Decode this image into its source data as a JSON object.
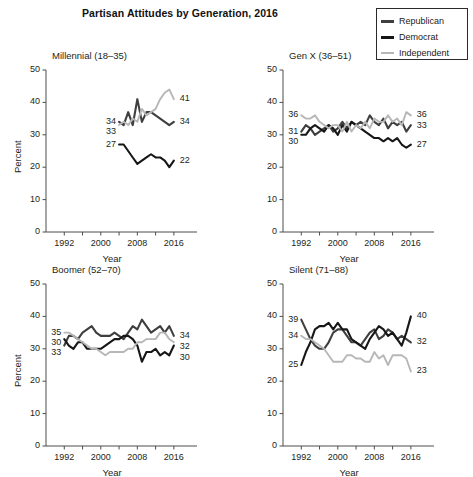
{
  "figure": {
    "title": "Partisan Attitudes by Generation, 2016",
    "xlabel": "Year",
    "ylabel": "Percent"
  },
  "legend": {
    "position": "top-right",
    "items": [
      {
        "label": "Republican",
        "color": "#3f3f3f"
      },
      {
        "label": "Democrat",
        "color": "#171717"
      },
      {
        "label": "Independent",
        "color": "#b7b7b7"
      }
    ]
  },
  "axes": {
    "yticks": [
      "0",
      "10",
      "20",
      "30",
      "40",
      "50"
    ],
    "xticks": [
      "1992",
      "2000",
      "2008",
      "2016"
    ],
    "ylim": [
      0,
      50
    ],
    "xlim": [
      1988,
      2018
    ],
    "grid": false
  },
  "chart_data": [
    {
      "type": "line",
      "title": "Millennial (18–35)",
      "xlabel": "Year",
      "ylabel": "Percent",
      "ylim": [
        0,
        50
      ],
      "xlim": [
        1988,
        2018
      ],
      "x": [
        2004,
        2005,
        2006,
        2007,
        2008,
        2009,
        2010,
        2011,
        2012,
        2013,
        2014,
        2015,
        2016
      ],
      "series": [
        {
          "name": "Republican",
          "color": "#3f3f3f",
          "start_label": "34",
          "end_label": "34",
          "values": [
            34,
            33,
            37,
            33,
            41,
            34,
            37,
            37,
            36,
            35,
            34,
            33,
            34
          ]
        },
        {
          "name": "Democrat",
          "color": "#171717",
          "start_label": "27",
          "end_label": "22",
          "values": [
            27,
            27,
            25,
            23,
            21,
            22,
            23,
            24,
            23,
            23,
            22,
            20,
            22
          ]
        },
        {
          "name": "Independent",
          "color": "#b7b7b7",
          "start_label": "33",
          "end_label": "41",
          "values": [
            33,
            34,
            33,
            35,
            34,
            38,
            36,
            37,
            38,
            41,
            43,
            44,
            41
          ]
        }
      ]
    },
    {
      "type": "line",
      "title": "Gen X (36–51)",
      "xlabel": "Year",
      "ylabel": "Percent",
      "ylim": [
        0,
        50
      ],
      "xlim": [
        1988,
        2018
      ],
      "x": [
        1992,
        1993,
        1994,
        1995,
        1996,
        1997,
        1998,
        1999,
        2000,
        2001,
        2002,
        2003,
        2004,
        2005,
        2006,
        2007,
        2008,
        2009,
        2010,
        2011,
        2012,
        2013,
        2014,
        2015,
        2016
      ],
      "series": [
        {
          "name": "Republican",
          "color": "#3f3f3f",
          "start_label": "31",
          "end_label": "33",
          "values": [
            31,
            33,
            32,
            30,
            31,
            32,
            33,
            31,
            32,
            34,
            32,
            34,
            33,
            34,
            33,
            36,
            34,
            33,
            35,
            32,
            34,
            33,
            34,
            31,
            33
          ]
        },
        {
          "name": "Democrat",
          "color": "#171717",
          "start_label": "30",
          "end_label": "27",
          "values": [
            30,
            30,
            32,
            33,
            32,
            31,
            33,
            32,
            30,
            33,
            31,
            34,
            33,
            32,
            31,
            30,
            29,
            29,
            28,
            29,
            28,
            29,
            27,
            26,
            27
          ]
        },
        {
          "name": "Independent",
          "color": "#b7b7b7",
          "start_label": "36",
          "end_label": "36",
          "values": [
            36,
            35,
            35,
            36,
            34,
            33,
            32,
            33,
            33,
            31,
            34,
            31,
            33,
            32,
            34,
            32,
            35,
            34,
            34,
            36,
            34,
            35,
            33,
            37,
            36
          ]
        }
      ]
    },
    {
      "type": "line",
      "title": "Boomer (52–70)",
      "xlabel": "Year",
      "ylabel": "Percent",
      "ylim": [
        0,
        50
      ],
      "xlim": [
        1988,
        2018
      ],
      "x": [
        1992,
        1993,
        1994,
        1995,
        1996,
        1997,
        1998,
        1999,
        2000,
        2001,
        2002,
        2003,
        2004,
        2005,
        2006,
        2007,
        2008,
        2009,
        2010,
        2011,
        2012,
        2013,
        2014,
        2015,
        2016
      ],
      "series": [
        {
          "name": "Republican",
          "color": "#3f3f3f",
          "start_label": "33",
          "end_label": "34",
          "values": [
            31,
            34,
            34,
            33,
            35,
            36,
            37,
            35,
            34,
            34,
            34,
            35,
            34,
            33,
            35,
            37,
            36,
            39,
            37,
            35,
            36,
            37,
            35,
            37,
            34
          ]
        },
        {
          "name": "Democrat",
          "color": "#171717",
          "start_label": "30",
          "end_label": "30",
          "values": [
            33,
            31,
            30,
            32,
            32,
            30,
            30,
            30,
            30,
            31,
            32,
            33,
            33,
            34,
            34,
            33,
            31,
            26,
            29,
            29,
            30,
            28,
            29,
            28,
            31
          ]
        },
        {
          "name": "Independent",
          "color": "#b7b7b7",
          "start_label": "35",
          "end_label": "32",
          "values": [
            35,
            35,
            34,
            33,
            32,
            31,
            30,
            30,
            29,
            28,
            29,
            29,
            29,
            29,
            30,
            30,
            32,
            32,
            33,
            33,
            33,
            35,
            35,
            33,
            32
          ]
        }
      ]
    },
    {
      "type": "line",
      "title": "Silent (71–88)",
      "xlabel": "Year",
      "ylabel": "Percent",
      "ylim": [
        0,
        50
      ],
      "xlim": [
        1988,
        2018
      ],
      "x": [
        1992,
        1993,
        1994,
        1995,
        1996,
        1997,
        1998,
        1999,
        2000,
        2001,
        2002,
        2003,
        2004,
        2005,
        2006,
        2007,
        2008,
        2009,
        2010,
        2011,
        2012,
        2013,
        2014,
        2015,
        2016
      ],
      "series": [
        {
          "name": "Republican",
          "color": "#3f3f3f",
          "start_label": "39",
          "end_label": "32",
          "values": [
            39,
            36,
            33,
            31,
            30,
            30,
            32,
            35,
            36,
            36,
            34,
            32,
            32,
            31,
            33,
            35,
            36,
            33,
            34,
            36,
            35,
            33,
            34,
            33,
            32
          ]
        },
        {
          "name": "Democrat",
          "color": "#171717",
          "start_label": "25",
          "end_label": "40",
          "values": [
            25,
            29,
            32,
            36,
            37,
            37,
            38,
            36,
            38,
            36,
            36,
            33,
            32,
            31,
            30,
            33,
            35,
            37,
            36,
            34,
            35,
            33,
            31,
            35,
            40
          ]
        },
        {
          "name": "Independent",
          "color": "#b7b7b7",
          "start_label": "34",
          "end_label": "23",
          "values": [
            34,
            33,
            33,
            32,
            31,
            30,
            28,
            26,
            26,
            26,
            28,
            28,
            27,
            27,
            26,
            26,
            29,
            27,
            28,
            25,
            28,
            28,
            28,
            27,
            23
          ]
        }
      ]
    }
  ]
}
